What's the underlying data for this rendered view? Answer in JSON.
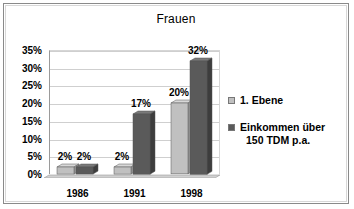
{
  "chart_data": {
    "type": "bar",
    "title": "Frauen",
    "xlabel": "",
    "ylabel": "",
    "categories": [
      "1986",
      "1991",
      "1998"
    ],
    "series": [
      {
        "name": "1. Ebene",
        "values": [
          2,
          2,
          20
        ],
        "color": "#c0c0c0",
        "labels": [
          "2%",
          "2%",
          "20%"
        ]
      },
      {
        "name": "Einkommen über 150 TDM p.a.",
        "values": [
          2,
          17,
          32
        ],
        "color": "#5a5a5a",
        "labels": [
          "2%",
          "17%",
          "32%"
        ]
      }
    ],
    "ylim": [
      0,
      35
    ],
    "ytick_values": [
      0,
      5,
      10,
      15,
      20,
      25,
      30,
      35
    ],
    "ytick_labels": [
      "0%",
      "5%",
      "10%",
      "15%",
      "20%",
      "25%",
      "30%",
      "35%"
    ],
    "grid": true,
    "legend_position": "right",
    "units": "percent",
    "style": "3d-bar"
  },
  "legend": {
    "entries": [
      {
        "label": "1. Ebene",
        "line2": ""
      },
      {
        "label": "Einkommen über",
        "line2": "150 TDM p.a."
      }
    ]
  },
  "colors": {
    "series_light": "#c0c0c0",
    "series_light_top": "#d8d8d8",
    "series_light_side": "#a0a0a0",
    "series_dark": "#5a5a5a",
    "series_dark_top": "#7a7a7a",
    "series_dark_side": "#3d3d3d",
    "gridline": "#cfcfcf",
    "axis": "#9a9a9a",
    "frame": "#8a8a8a",
    "floor": "#d0d0d0",
    "background": "#ffffff",
    "text": "#000000"
  }
}
